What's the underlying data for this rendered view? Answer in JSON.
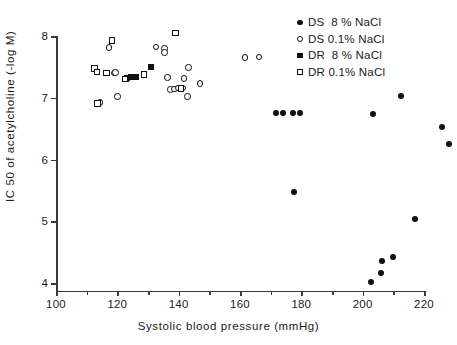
{
  "chart_data": {
    "type": "scatter",
    "title": "",
    "xlabel": "Systolic blood pressure (mmHg)",
    "ylabel": "IC 50 of acetylcholine (-log M)",
    "xlim": [
      100,
      220
    ],
    "ylim": [
      4,
      8
    ],
    "xticks": [
      100,
      120,
      140,
      160,
      180,
      200,
      220
    ],
    "xticklabels": [
      "100",
      "120",
      "140",
      "160",
      "180",
      "200",
      "220"
    ],
    "x_minor_ticks": [
      110,
      130,
      150,
      170,
      190,
      210
    ],
    "yticks": [
      4,
      5,
      6,
      7,
      8
    ],
    "yticklabels": [
      "4",
      "5",
      "6",
      "7",
      "8"
    ],
    "grid": false,
    "legend_position": "top-right",
    "series": [
      {
        "name": "DS  8 % NaCl",
        "marker": "filled-circle",
        "color": "#101010",
        "points": [
          [
            171.8,
            6.75
          ],
          [
            174.0,
            6.75
          ],
          [
            177.3,
            6.75
          ],
          [
            179.5,
            6.75
          ],
          [
            177.5,
            5.48
          ],
          [
            202.6,
            4.02
          ],
          [
            203.5,
            6.74
          ],
          [
            206.0,
            4.17
          ],
          [
            206.2,
            4.35
          ],
          [
            209.8,
            4.42
          ],
          [
            212.5,
            7.03
          ],
          [
            217.2,
            5.04
          ],
          [
            225.8,
            6.53
          ],
          [
            228.3,
            6.25
          ]
        ]
      },
      {
        "name": "DS 0.1% NaCl",
        "marker": "open-circle",
        "color": "#101010",
        "points": [
          [
            114.4,
            6.92
          ],
          [
            117.3,
            7.81
          ],
          [
            118.9,
            7.4
          ],
          [
            119.4,
            7.41
          ],
          [
            120.1,
            7.02
          ],
          [
            132.6,
            7.82
          ],
          [
            135.3,
            7.8
          ],
          [
            135.4,
            7.73
          ],
          [
            136.3,
            7.33
          ],
          [
            137.3,
            7.13
          ],
          [
            138.7,
            7.14
          ],
          [
            139.9,
            7.16
          ],
          [
            141.4,
            7.16
          ],
          [
            141.7,
            7.31
          ],
          [
            142.9,
            7.02
          ],
          [
            143.2,
            7.49
          ],
          [
            147.0,
            7.23
          ],
          [
            161.7,
            7.65
          ],
          [
            166.2,
            7.66
          ]
        ]
      },
      {
        "name": "DR  8 % NaCl",
        "marker": "filled-square",
        "color": "#101010",
        "points": [
          [
            122.8,
            7.31
          ],
          [
            123.3,
            7.32
          ],
          [
            124.6,
            7.33
          ],
          [
            126.2,
            7.34
          ],
          [
            131.1,
            7.5
          ]
        ]
      },
      {
        "name": "DR 0.1% NaCl",
        "marker": "open-square",
        "color": "#101010",
        "points": [
          [
            112.5,
            7.47
          ],
          [
            113.3,
            7.42
          ],
          [
            113.6,
            6.91
          ],
          [
            116.5,
            7.4
          ],
          [
            118.2,
            7.93
          ],
          [
            122.5,
            7.3
          ],
          [
            128.7,
            7.38
          ],
          [
            139.0,
            8.05
          ],
          [
            140.8,
            7.15
          ]
        ]
      }
    ]
  },
  "legend": {
    "items": [
      {
        "label": "DS  8 % NaCl",
        "marker": "filled-circle"
      },
      {
        "label": "DS 0.1% NaCl",
        "marker": "open-circle"
      },
      {
        "label": "DR  8 % NaCl",
        "marker": "filled-square"
      },
      {
        "label": "DR 0.1% NaCl",
        "marker": "open-square"
      }
    ]
  }
}
